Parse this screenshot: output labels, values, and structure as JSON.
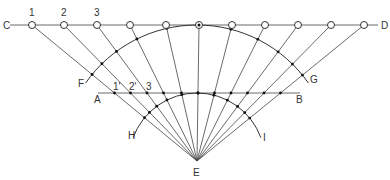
{
  "diagram": {
    "type": "geometric-construction",
    "line_top": {
      "left_label": "C",
      "right_label": "D",
      "y": 25,
      "x1": 10,
      "x2": 378
    },
    "line_mid": {
      "left_label": "A",
      "right_label": "B",
      "y": 93,
      "x1": 98,
      "x2": 300
    },
    "apex": {
      "label": "E",
      "x": 197,
      "y": 161
    },
    "top_points_x": [
      32,
      64,
      97,
      130,
      166,
      199,
      232,
      265,
      298,
      331,
      364
    ],
    "top_numbers": [
      {
        "text": "1",
        "x": 32,
        "y": 16
      },
      {
        "text": "2",
        "x": 64,
        "y": 16
      },
      {
        "text": "3",
        "x": 97,
        "y": 16
      }
    ],
    "mid_numbers": [
      {
        "text": "1'",
        "x": 116,
        "y": 90
      },
      {
        "text": "2'",
        "x": 132,
        "y": 90
      },
      {
        "text": "3",
        "x": 149,
        "y": 90
      }
    ],
    "arc_outer": {
      "start_label": "F",
      "end_label": "G",
      "radius": 136
    },
    "arc_inner": {
      "start_label": "H",
      "end_label": "I",
      "radius": 68
    },
    "labels": {
      "C": {
        "text": "C",
        "x": 3,
        "y": 29
      },
      "D": {
        "text": "D",
        "x": 381,
        "y": 29
      },
      "A": {
        "text": "A",
        "x": 94,
        "y": 103
      },
      "B": {
        "text": "B",
        "x": 296,
        "y": 103
      },
      "E": {
        "text": "E",
        "x": 193,
        "y": 176
      },
      "F": {
        "text": "F",
        "x": 78,
        "y": 87
      },
      "G": {
        "text": "G",
        "x": 310,
        "y": 83
      },
      "H": {
        "text": "H",
        "x": 128,
        "y": 139
      },
      "I": {
        "text": "I",
        "x": 263,
        "y": 141
      }
    }
  }
}
